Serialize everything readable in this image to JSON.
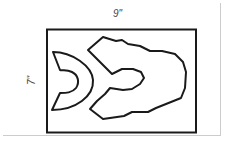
{
  "diagram": {
    "width_label": "9\"",
    "height_label": "7\"",
    "colors": {
      "stroke": "#1a1a1a",
      "background": "#ffffff"
    }
  }
}
